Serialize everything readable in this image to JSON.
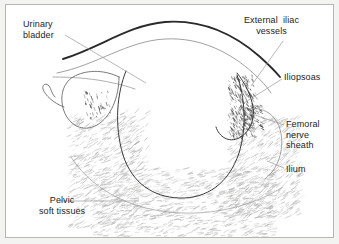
{
  "figure": {
    "kind": "anatomical-line-drawing",
    "title_visible": false,
    "background_color": "#ffffff",
    "outer_margin_color": "#f3f3f1",
    "border_color": "#b6b6b4",
    "ink_color": "#1d1d1d",
    "line_color": "#3a3a3a",
    "faint_line_color": "#8e8e8e",
    "leader_color": "#9a9a9a",
    "hatch_color": "#b0aeac",
    "stipple_color": "#4a4a4a"
  },
  "labels": [
    {
      "id": "urinary-bladder",
      "name": "urinary-bladder",
      "lines": [
        "Urinary",
        "bladder"
      ],
      "text": "Urinary bladder",
      "align": "left",
      "x": 22,
      "y": 18
    },
    {
      "id": "external-iliac-vessels",
      "name": "external-iliac-vessels",
      "lines": [
        "External  iliac",
        "vessels"
      ],
      "text": "External iliac vessels",
      "align": "center",
      "x": 243,
      "y": 14
    },
    {
      "id": "iliopsoas",
      "name": "iliopsoas",
      "lines": [
        "Iliopsoas"
      ],
      "text": "Iliopsoas",
      "align": "left",
      "x": 283,
      "y": 71
    },
    {
      "id": "femoral-nerve-sheath",
      "name": "femoral-nerve-sheath",
      "lines": [
        "Femoral",
        "nerve",
        "sheath"
      ],
      "text": "Femoral nerve sheath",
      "align": "left",
      "x": 285,
      "y": 118
    },
    {
      "id": "ilium",
      "name": "ilium",
      "lines": [
        "Ilium"
      ],
      "text": "Ilium",
      "align": "left",
      "x": 285,
      "y": 163
    },
    {
      "id": "pelvic-soft-tissues",
      "name": "pelvic-soft-tissues",
      "lines": [
        "Pelvic",
        "soft tissues"
      ],
      "text": "Pelvic soft tissues",
      "align": "center",
      "x": 38,
      "y": 194
    }
  ],
  "leaders": [
    {
      "id": "leader-urinary-bladder",
      "from": [
        64,
        34
      ],
      "to": [
        145,
        82
      ]
    },
    {
      "id": "leader-external-iliac-vessels",
      "from": [
        282,
        40
      ],
      "to": [
        250,
        85
      ]
    },
    {
      "id": "leader-iliopsoas",
      "from": [
        281,
        78
      ],
      "to": [
        243,
        102
      ]
    },
    {
      "id": "leader-femoral-nerve-sheath",
      "from": [
        283,
        124
      ],
      "to": [
        248,
        112
      ]
    },
    {
      "id": "leader-ilium",
      "from": [
        283,
        167
      ],
      "to": [
        266,
        160
      ]
    },
    {
      "id": "leader-pelvic-soft-tissues",
      "from": [
        58,
        200
      ],
      "to": [
        138,
        200
      ]
    }
  ],
  "structures": [
    {
      "id": "abdominal-wall-outer",
      "name": "abdominal-wall-outer-contour",
      "kind": "thick-curve",
      "path": "M 62,58 C 100,46 128,24 164,21 C 204,18 236,36 258,55 C 268,64 274,70 279,76",
      "width": 1.9,
      "color": "#2a2a2a"
    },
    {
      "id": "abdominal-wall-inner",
      "name": "abdominal-wall-inner-contour",
      "kind": "thin-curve",
      "path": "M 56,72 C 96,64 126,40 164,38 C 200,36 230,52 252,72 C 260,79 266,86 270,92",
      "width": 0.8,
      "color": "#888888"
    },
    {
      "id": "fascial-plane-left",
      "name": "fascial-plane-left",
      "kind": "thin-curve",
      "path": "M 52,76 C 74,76 96,78 112,82 C 122,84 128,86 134,88",
      "width": 0.8,
      "color": "#9a9a9a"
    },
    {
      "id": "pelvic-cavity",
      "name": "pelvic-cavity-outline",
      "kind": "thin-curve",
      "path": "M 125,70 C 116,92 113,124 122,154 C 131,182 152,196 178,197 C 206,198 228,182 238,152 C 246,126 244,96 236,74",
      "width": 1.0,
      "color": "#3a3a3a"
    },
    {
      "id": "bladder",
      "name": "urinary-bladder-outline",
      "kind": "closed-curve",
      "path": "M 118,76 C 118,96 110,116 96,124 C 82,132 68,124 63,110 C 58,96 62,82 72,76 C 84,69 102,68 118,76 Z",
      "width": 0.9,
      "color": "#6a6a6a"
    },
    {
      "id": "bladder-tail",
      "name": "bladder-tail-hook",
      "kind": "thin-curve",
      "path": "M 63,106 C 52,102 44,94 42,88 C 41,84 44,82 47,84 C 50,86 50,92 54,96",
      "width": 0.9,
      "color": "#6a6a6a"
    },
    {
      "id": "iliopsoas-band",
      "name": "iliopsoas-band",
      "kind": "stippled-band",
      "path": "M 236,72 C 244,82 250,94 252,106 C 254,120 248,132 238,137 C 228,142 218,136 215,126",
      "width": 1.0,
      "color": "#3a3a3a"
    },
    {
      "id": "ilium-contour",
      "name": "ilium-contour",
      "kind": "thin-curve",
      "path": "M 248,108 C 258,106 268,110 274,118 C 280,126 282,138 280,150 C 278,162 272,172 264,178",
      "width": 0.8,
      "color": "#8e8e8e"
    },
    {
      "id": "soft-tissue-floor",
      "name": "pelvic-soft-tissue-floor",
      "kind": "thin-curve",
      "path": "M 70,156 C 88,184 120,204 160,210 C 206,217 250,206 282,186",
      "width": 0.7,
      "color": "#9a9a9a"
    }
  ],
  "hatch_regions": [
    {
      "id": "hatch-left-pelvic",
      "name": "hatch-left-pelvic-soft-tissue",
      "seed": 11,
      "count": 520,
      "x": 66,
      "y": 116,
      "w": 70,
      "h": 112,
      "angle": -28
    },
    {
      "id": "hatch-floor",
      "name": "hatch-pelvic-floor-soft-tissue",
      "seed": 29,
      "count": 900,
      "x": 92,
      "y": 168,
      "w": 180,
      "h": 68,
      "angle": -14
    },
    {
      "id": "hatch-right-pelvic",
      "name": "hatch-right-pelvic-soft-tissue",
      "seed": 47,
      "count": 620,
      "x": 226,
      "y": 118,
      "w": 72,
      "h": 100,
      "angle": -34
    },
    {
      "id": "hatch-bladder-wall",
      "name": "hatch-bladder-wall",
      "seed": 63,
      "count": 90,
      "x": 112,
      "y": 110,
      "w": 34,
      "h": 60,
      "angle": -40
    }
  ],
  "stipple_regions": [
    {
      "id": "stipple-iliopsoas",
      "name": "stipple-iliopsoas",
      "seed": 5,
      "count": 260,
      "x": 228,
      "y": 74,
      "w": 26,
      "h": 62,
      "angle": 62
    },
    {
      "id": "stipple-femoral-sheath",
      "name": "stipple-femoral-nerve-sheath",
      "seed": 17,
      "count": 70,
      "x": 242,
      "y": 104,
      "w": 18,
      "h": 24,
      "angle": 30
    },
    {
      "id": "stipple-bladder-interior",
      "name": "stipple-bladder-interior",
      "seed": 23,
      "count": 40,
      "x": 82,
      "y": 90,
      "w": 26,
      "h": 28,
      "angle": 70
    }
  ]
}
